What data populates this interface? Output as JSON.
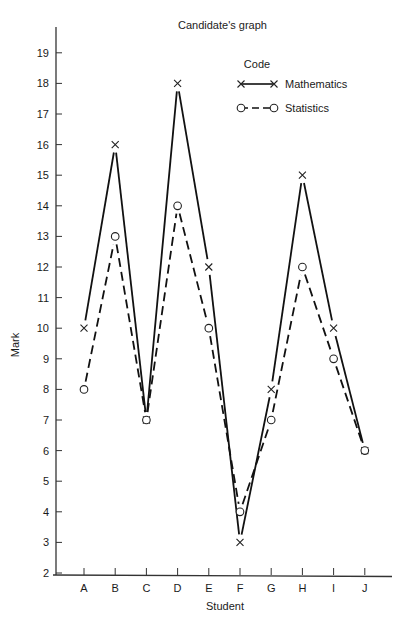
{
  "chart_data": {
    "type": "line",
    "title": "Candidate's graph",
    "xlabel": "Student",
    "ylabel": "Mark",
    "categories": [
      "A",
      "B",
      "C",
      "D",
      "E",
      "F",
      "G",
      "H",
      "I",
      "J"
    ],
    "yticks": [
      2,
      3,
      4,
      5,
      6,
      7,
      8,
      9,
      10,
      11,
      12,
      13,
      14,
      15,
      16,
      17,
      18,
      19
    ],
    "ylim": [
      2,
      19
    ],
    "grid": false,
    "legend": {
      "title": "Code",
      "position": "upper-right",
      "entries": [
        {
          "label": "Mathematics",
          "marker": "x",
          "line": "solid"
        },
        {
          "label": "Statistics",
          "marker": "o",
          "line": "dashed"
        }
      ]
    },
    "series": [
      {
        "name": "Mathematics",
        "marker": "x",
        "line": "solid",
        "values": [
          10,
          16,
          7,
          18,
          12,
          3,
          8,
          15,
          10,
          6
        ]
      },
      {
        "name": "Statistics",
        "marker": "o",
        "line": "dashed",
        "values": [
          8,
          13,
          7,
          14,
          10,
          4,
          7,
          12,
          9,
          6
        ]
      }
    ]
  }
}
